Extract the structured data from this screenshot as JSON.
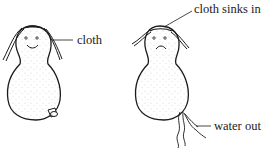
{
  "figure": {
    "panels": [
      {
        "id": "before",
        "state": "cloth on top, plug in, smiling face",
        "labels": [
          {
            "text": "cloth"
          }
        ]
      },
      {
        "id": "after",
        "state": "cloth sunk in, plug removed, frowning face",
        "labels": [
          {
            "text": "cloth sinks in"
          },
          {
            "text": "water out"
          }
        ]
      }
    ],
    "colors": {
      "ink": "#1a1a1a",
      "background": "#ffffff"
    }
  }
}
